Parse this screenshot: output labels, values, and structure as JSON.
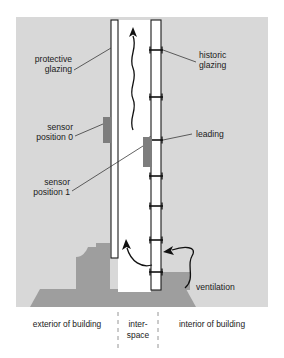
{
  "figure": {
    "kind": "architectural-cross-section",
    "colors": {
      "page_background": "#ffffff",
      "wall_background": "#d8d8d8",
      "masonry": "#9e9e9e",
      "glazing_fill": "#ffffff",
      "glazing_outline": "#1a1a1a",
      "sensor_block": "#7d7d7d",
      "leader_line": "#3a3a3a",
      "arrow": "#111111",
      "divider_dash": "#8a8a8a",
      "text": "#1a1a1a"
    }
  },
  "labels": {
    "protective_glazing": {
      "line1": "protective",
      "line2": "glazing"
    },
    "historic_glazing": {
      "line1": "historic",
      "line2": "glazing"
    },
    "sensor_position_0": {
      "line1": "sensor",
      "line2": "position 0"
    },
    "sensor_position_1": {
      "line1": "sensor",
      "line2": "position 1"
    },
    "leading": "leading",
    "ventilation": "ventilation"
  },
  "zones": {
    "exterior": "exterior of building",
    "interspace": {
      "line1": "inter-",
      "line2": "space"
    },
    "interior": "interior of building"
  },
  "elements": {
    "protective_glazing_pane": {
      "name": "protective-glazing-pane",
      "x": 111,
      "top": 20,
      "bottom": 258,
      "width": 7
    },
    "historic_glazing_pane": {
      "name": "historic-glazing-pane",
      "x": 151,
      "top": 20,
      "bottom": 290,
      "width": 10
    },
    "leading_bars": {
      "count": 7,
      "y_positions": [
        50,
        97,
        140,
        176,
        206,
        240,
        272
      ]
    },
    "sensor_block_0": {
      "x": 103,
      "y": 117,
      "width": 8,
      "height": 26
    },
    "sensor_block_1": {
      "x": 143,
      "y": 137,
      "width": 9,
      "height": 30
    },
    "convection_arrow": {
      "name": "wavy-convection-arrow",
      "direction": "upward",
      "x": 133,
      "top": 27,
      "bottom": 130
    },
    "inflow_arrow": {
      "name": "interspace-inflow-arrow",
      "direction": "up-left-curve"
    },
    "ventilation_arrow": {
      "name": "ventilation-s-arrow",
      "direction": "into-interspace"
    }
  }
}
